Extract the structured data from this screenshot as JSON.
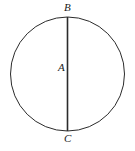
{
  "figure": {
    "background_color": "#ffffff",
    "stroke_color": "#2b2b2b",
    "label_color": "#1a1a1a",
    "width": 135,
    "height": 151
  },
  "labels": {
    "top": "B",
    "center": "A",
    "bottom": "C"
  },
  "geometry": {
    "circle": {
      "center_x": 67.5,
      "center_y": 74,
      "radius": 57,
      "stroke_width": 1
    },
    "diameter_line": {
      "x": 67.5,
      "y1": 17,
      "y2": 131,
      "stroke_width": 1.6
    }
  }
}
